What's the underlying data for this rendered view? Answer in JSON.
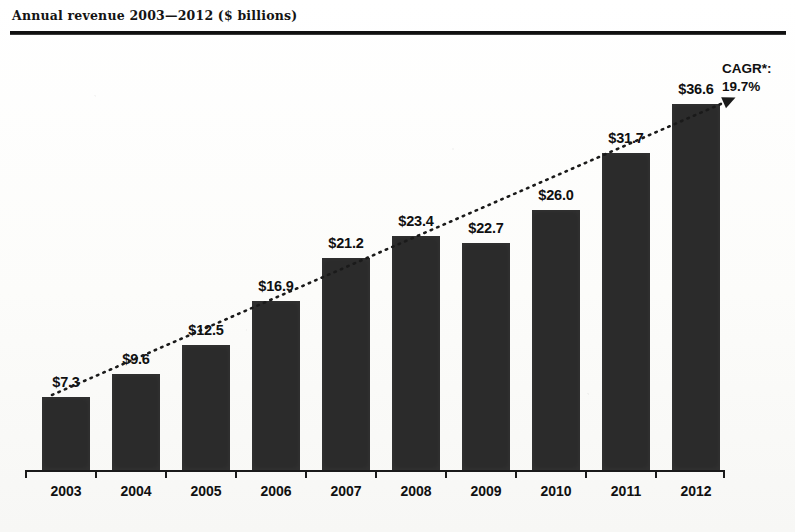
{
  "chart_data": {
    "type": "bar",
    "title": "Annual revenue 2003—2012 ($ billions)",
    "xlabel": "",
    "ylabel": "",
    "ylim": [
      0,
      40
    ],
    "grid": false,
    "legend": "none",
    "categories": [
      "2003",
      "2004",
      "2005",
      "2006",
      "2007",
      "2008",
      "2009",
      "2010",
      "2011",
      "2012"
    ],
    "values": [
      7.3,
      9.6,
      12.5,
      16.9,
      21.2,
      23.4,
      22.7,
      26.0,
      31.7,
      36.6
    ],
    "data_labels": [
      "$7.3",
      "$9.6",
      "$12.5",
      "$16.9",
      "$21.2",
      "$23.4",
      "$22.7",
      "$26.0",
      "$31.7",
      "$36.6"
    ],
    "bar_color": "#2b2b2b",
    "annotations": [
      {
        "name": "cagr",
        "label": "CAGR*:",
        "value": "19.7%",
        "note": "dotted trend arrow rising left-to-right across bar tops"
      }
    ]
  },
  "header": {
    "title": "Annual revenue 2003—2012 ($ billions)"
  },
  "annotation": {
    "cagr_label": "CAGR*:",
    "cagr_value": "19.7%"
  }
}
